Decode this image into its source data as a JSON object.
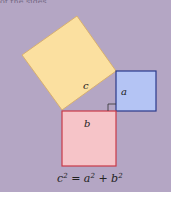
{
  "figure": {
    "caption_fragment": "of the sides.",
    "labels": {
      "c": "c",
      "a": "a",
      "b": "b"
    },
    "equation": {
      "c": "c",
      "a": "a",
      "b": "b",
      "exp": "2",
      "eq": " = ",
      "plus": " + "
    },
    "colors": {
      "background": "#b4a6c4",
      "square_c_fill": "#fbe0a0",
      "square_c_stroke": "#d8b070",
      "square_a_fill": "#b4c4f4",
      "square_a_stroke": "#2a3a8a",
      "square_b_fill": "#f6c4c8",
      "square_b_stroke": "#c83a48"
    }
  }
}
